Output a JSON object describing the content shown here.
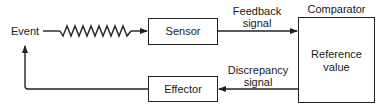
{
  "diagram": {
    "type": "feedback-control-loop",
    "nodes": {
      "event": {
        "label": "Event"
      },
      "sensor": {
        "label": "Sensor"
      },
      "comparator": {
        "title": "Comparator",
        "content_line1": "Reference",
        "content_line2": "value"
      },
      "effector": {
        "label": "Effector"
      }
    },
    "edges": {
      "event_to_sensor": {
        "style": "zigzag",
        "label": ""
      },
      "feedback": {
        "label_line1": "Feedback",
        "label_line2": "signal"
      },
      "discrepancy": {
        "label_line1": "Discrepancy",
        "label_line2": "signal"
      },
      "effector_to_event": {
        "label": ""
      }
    }
  },
  "colors": {
    "stroke": "#222222",
    "background": "#ffffff",
    "text": "#1a1a1a"
  }
}
